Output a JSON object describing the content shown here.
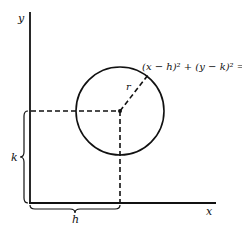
{
  "diagram": {
    "axes": {
      "x_label": "x",
      "y_label": "y"
    },
    "circle": {
      "center_label": "(h, k)",
      "radius_label": "r",
      "equation": "(x − h)² + (y − k)² = r²"
    },
    "braces": {
      "horizontal_label": "h",
      "vertical_label": "k"
    },
    "colors": {
      "stroke": "#111111",
      "background": "#ffffff"
    }
  }
}
